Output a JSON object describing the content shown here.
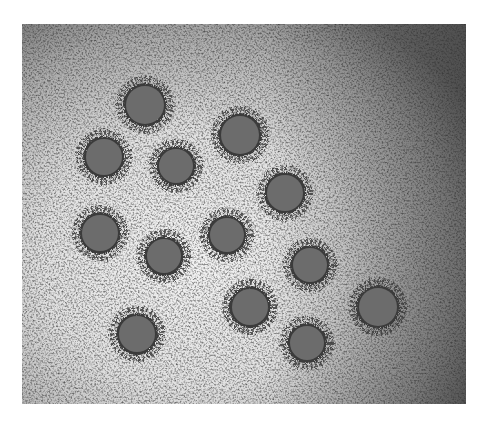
{
  "image": {
    "subject": "electron micrograph of spherical virus particles with spiky envelope",
    "frame": {
      "x": 22,
      "y": 24,
      "width": 444,
      "height": 380
    },
    "colors": {
      "page_background": "#ffffff",
      "light_background": "#e6e6e6",
      "dark_background": "#6e6e6e",
      "particle_core": "#6c6c6c",
      "particle_fringe": "#3a3a3a"
    },
    "particles": [
      {
        "cx": 123,
        "cy": 81,
        "r": 22
      },
      {
        "cx": 218,
        "cy": 111,
        "r": 22
      },
      {
        "cx": 82,
        "cy": 133,
        "r": 21
      },
      {
        "cx": 154,
        "cy": 142,
        "r": 20
      },
      {
        "cx": 263,
        "cy": 169,
        "r": 21
      },
      {
        "cx": 78,
        "cy": 209,
        "r": 21
      },
      {
        "cx": 205,
        "cy": 211,
        "r": 20
      },
      {
        "cx": 142,
        "cy": 232,
        "r": 20
      },
      {
        "cx": 288,
        "cy": 241,
        "r": 20
      },
      {
        "cx": 356,
        "cy": 283,
        "r": 22
      },
      {
        "cx": 228,
        "cy": 283,
        "r": 21
      },
      {
        "cx": 115,
        "cy": 310,
        "r": 21
      },
      {
        "cx": 285,
        "cy": 319,
        "r": 20
      }
    ]
  }
}
